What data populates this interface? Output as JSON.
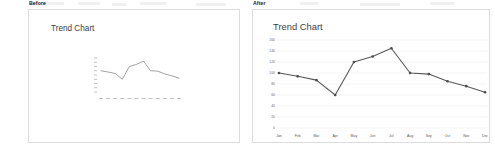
{
  "page": {
    "background": "#ffffff",
    "line_color": "#595959",
    "grid_color": "#e9e9e9",
    "border_color": "#dcdcdc",
    "text_color": "#404040"
  },
  "before": {
    "label": "Before",
    "chart_title": "Trend Chart"
  },
  "after": {
    "label": "After",
    "chart_title": "Trend Chart"
  },
  "chart_data": {
    "type": "line",
    "title": "Trend Chart",
    "xlabel": "",
    "ylabel": "",
    "categories": [
      "Jan",
      "Feb",
      "Mar",
      "Apr",
      "May",
      "Jun",
      "Jul",
      "Aug",
      "Sep",
      "Oct",
      "Nov",
      "Dec"
    ],
    "values": [
      100,
      94,
      87,
      60,
      120,
      130,
      145,
      100,
      98,
      85,
      76,
      65
    ],
    "ylim": [
      0,
      160
    ],
    "yticks": [
      0,
      20,
      40,
      60,
      80,
      100,
      120,
      140,
      160
    ],
    "grid": true,
    "legend": "none",
    "series": [
      {
        "name": "Trend",
        "values": [
          100,
          94,
          87,
          60,
          120,
          130,
          145,
          100,
          98,
          85,
          76,
          65
        ]
      }
    ]
  }
}
